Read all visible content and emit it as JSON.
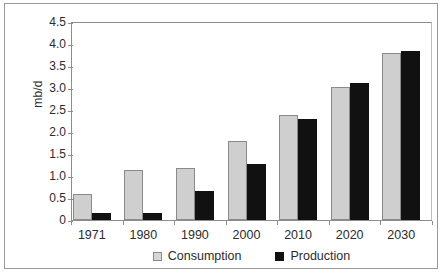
{
  "figure": {
    "y_axis_title": "mb/d",
    "legend_position": "bottom-center",
    "background_color": "#ffffff",
    "frame_color": "#9a9a9a"
  },
  "colors": {
    "consumption": "#cfcfcf",
    "consumption_border": "#8a8a8a",
    "production": "#111111",
    "axis": "#8d8d8d",
    "text": "#2b2b2b"
  },
  "chart_data": {
    "type": "bar",
    "title": "",
    "xlabel": "",
    "ylabel": "mb/d",
    "ylim": [
      0,
      4.5
    ],
    "ytick_labels": [
      "4.5",
      "4.0",
      "3.5",
      "3.0",
      "2.5",
      "2.0",
      "1.5",
      "1.0",
      "0.5",
      "0"
    ],
    "ytick_values": [
      4.5,
      4.0,
      3.5,
      3.0,
      2.5,
      2.0,
      1.5,
      1.0,
      0.5,
      0
    ],
    "grid": false,
    "categories": [
      "1971",
      "1980",
      "1990",
      "2000",
      "2010",
      "2020",
      "2030"
    ],
    "series": [
      {
        "name": "Consumption",
        "color": "#cfcfcf",
        "values": [
          0.58,
          1.13,
          1.19,
          1.79,
          2.38,
          3.02,
          3.8
        ]
      },
      {
        "name": "Production",
        "color": "#111111",
        "values": [
          0.17,
          0.17,
          0.65,
          1.28,
          2.29,
          3.12,
          3.85
        ]
      }
    ],
    "legend": [
      "Consumption",
      "Production"
    ],
    "legend_position": "bottom"
  }
}
